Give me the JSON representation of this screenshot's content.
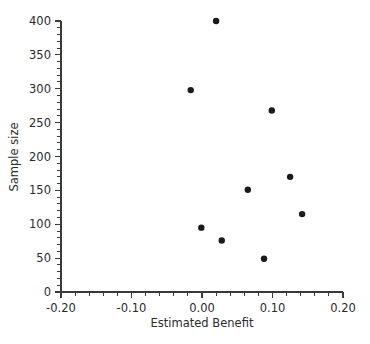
{
  "chart_data": {
    "type": "scatter",
    "title": "",
    "xlabel": "Estimated Benefit",
    "ylabel": "Sample size",
    "xlim": [
      -0.2,
      0.2
    ],
    "ylim": [
      0,
      400
    ],
    "grid": false,
    "legend": null,
    "x_ticks": [
      -0.2,
      -0.1,
      0.0,
      0.1,
      0.2
    ],
    "x_tick_labels": [
      "-0.20",
      "-0.10",
      "0.00",
      "0.10",
      "0.20"
    ],
    "x_minor_step": 0.02,
    "y_ticks": [
      0,
      50,
      100,
      150,
      200,
      250,
      300,
      350,
      400
    ],
    "y_tick_labels": [
      "0",
      "50",
      "100",
      "150",
      "200",
      "250",
      "300",
      "350",
      "400"
    ],
    "y_minor_step": 10,
    "marker": "circle",
    "marker_color": "#1a1a1a",
    "marker_size": 3.2,
    "points": [
      {
        "x": 0.02,
        "y": 400
      },
      {
        "x": -0.016,
        "y": 298
      },
      {
        "x": 0.099,
        "y": 268
      },
      {
        "x": 0.125,
        "y": 170
      },
      {
        "x": 0.065,
        "y": 151
      },
      {
        "x": 0.142,
        "y": 115
      },
      {
        "x": -0.001,
        "y": 95
      },
      {
        "x": 0.028,
        "y": 76
      },
      {
        "x": 0.088,
        "y": 49
      }
    ]
  },
  "axes": {
    "x_axis_name": "Estimated Benefit",
    "y_axis_name": "Sample size"
  }
}
